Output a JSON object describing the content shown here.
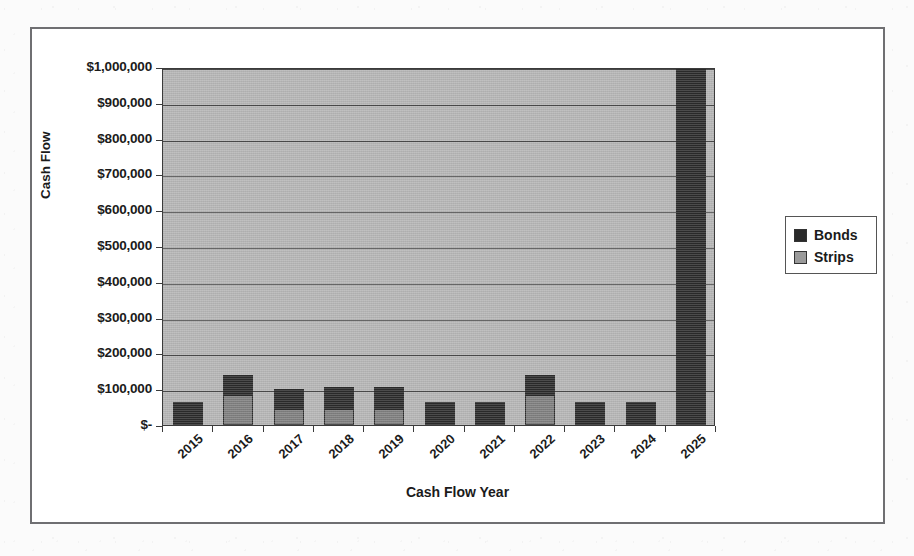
{
  "chart_data": {
    "type": "bar",
    "subtype": "stacked-column",
    "title": "",
    "xlabel": "Cash Flow Year",
    "ylabel": "Cash Flow",
    "categories": [
      "2015",
      "2016",
      "2017",
      "2018",
      "2019",
      "2020",
      "2021",
      "2022",
      "2023",
      "2024",
      "2025"
    ],
    "series": [
      {
        "name": "Strips",
        "color": "#7d7d7d",
        "values": [
          0,
          85000,
          45000,
          45000,
          45000,
          0,
          0,
          85000,
          0,
          0,
          0
        ]
      },
      {
        "name": "Bonds",
        "color": "#2a2a2a",
        "values": [
          65000,
          55000,
          55000,
          60000,
          60000,
          65000,
          65000,
          55000,
          65000,
          65000,
          1000000
        ]
      }
    ],
    "stack_order": [
      "Strips",
      "Bonds"
    ],
    "totals": [
      65000,
      140000,
      100000,
      105000,
      105000,
      65000,
      65000,
      140000,
      65000,
      65000,
      1000000
    ],
    "ylim": [
      0,
      1000000
    ],
    "ytick_step": 100000,
    "ytick_labels": [
      "$1,000,000",
      "$900,000",
      "$800,000",
      "$700,000",
      "$600,000",
      "$500,000",
      "$400,000",
      "$300,000",
      "$200,000",
      "$100,000",
      "$-"
    ],
    "ytick_values": [
      1000000,
      900000,
      800000,
      700000,
      600000,
      500000,
      400000,
      300000,
      200000,
      100000,
      0
    ],
    "grid": true,
    "grid_axis": "y",
    "legend_position": "right",
    "legend_entries": [
      "Bonds",
      "Strips"
    ],
    "plot_background": "#b4b4b4",
    "note_2025": "2025 column reaches the top of the axis (clipped at $1,000,000)"
  },
  "axes": {
    "y_title": "Cash Flow",
    "x_title": "Cash Flow Year"
  },
  "legend": {
    "items": [
      {
        "label": "Bonds",
        "color": "#2a2a2a"
      },
      {
        "label": "Strips",
        "color": "#9a9a9a"
      }
    ]
  }
}
